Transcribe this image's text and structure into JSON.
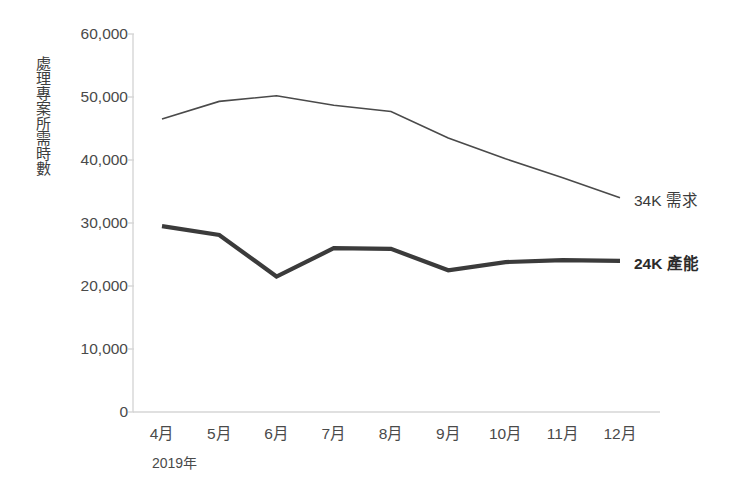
{
  "chart_data": {
    "type": "line",
    "title": "",
    "xlabel": "2019年",
    "ylabel": "處理專案所需時數",
    "categories": [
      "4月",
      "5月",
      "6月",
      "7月",
      "8月",
      "9月",
      "10月",
      "11月",
      "12月"
    ],
    "ylim": [
      0,
      60000
    ],
    "yticks": [
      60000,
      50000,
      40000,
      30000,
      20000,
      10000,
      0
    ],
    "ytick_labels": [
      "60,000",
      "50,000",
      "40,000",
      "30,000",
      "20,000",
      "10,000",
      "0"
    ],
    "grid": false,
    "legend_position": "right-inline",
    "series": [
      {
        "name": "需求",
        "end_label": "34K 需求",
        "color": "#4a4a4a",
        "line_width": 1.6,
        "bold": false,
        "values": [
          46500,
          49300,
          50200,
          48700,
          47700,
          43500,
          40200,
          37200,
          34000
        ]
      },
      {
        "name": "產能",
        "end_label": "24K 產能",
        "color": "#3b3b3b",
        "line_width": 4.2,
        "bold": true,
        "values": [
          29500,
          28100,
          21500,
          26000,
          25900,
          22500,
          23800,
          24100,
          24000
        ]
      }
    ],
    "annotations": [
      {
        "text": "34K 需求",
        "series": "需求"
      },
      {
        "text": "24K 產能",
        "series": "產能"
      }
    ]
  },
  "axis": {
    "y_title": "處理專案所需時數",
    "x_year": "2019年",
    "axis_color": "#d6d6d6"
  },
  "colors": {
    "demand": "#4a4a4a",
    "capacity": "#3b3b3b",
    "axis": "#d6d6d6",
    "text": "#4a4a4a",
    "background": "#ffffff"
  }
}
